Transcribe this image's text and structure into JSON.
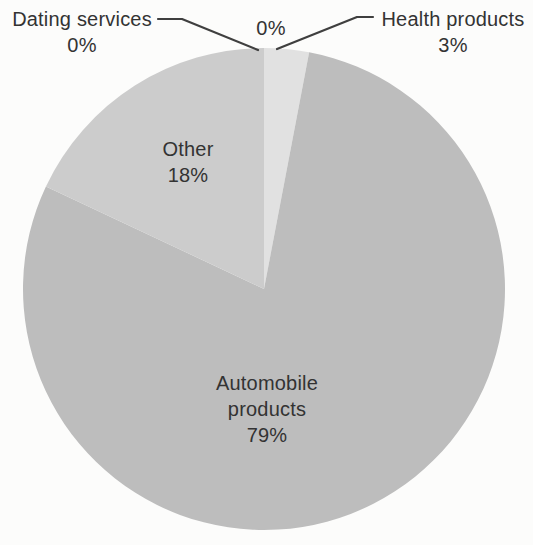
{
  "chart_data": {
    "type": "pie",
    "title": "",
    "legend": "none",
    "direction": "clockwise",
    "start_angle_deg": 0,
    "center": [
      264,
      289
    ],
    "radius": 241,
    "slices": [
      {
        "label": "Dating services",
        "value": 0,
        "color": "#e1e1e1"
      },
      {
        "label": "",
        "value": 0,
        "color": "#e1e1e1"
      },
      {
        "label": "Health products",
        "value": 3,
        "color": "#e1e1e1"
      },
      {
        "label": "Automobile products",
        "value": 79,
        "color": "#bdbdbd"
      },
      {
        "label": "Other",
        "value": 18,
        "color": "#cccccc"
      }
    ]
  },
  "labels": {
    "dating_name": "Dating services",
    "dating_pct": "0%",
    "zero_pct": "0%",
    "health_name": "Health products",
    "health_pct": "3%",
    "other_name": "Other",
    "other_pct": "18%",
    "auto_name": "Automobile products",
    "auto_pct": "79%"
  }
}
